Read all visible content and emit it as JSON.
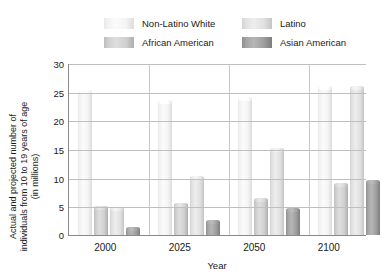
{
  "legend": {
    "items": [
      {
        "label": "Non-Latino White",
        "key": "white",
        "color": "#f2f2f2"
      },
      {
        "label": "Latino",
        "key": "latino",
        "color": "#e4e4e4"
      },
      {
        "label": "African American",
        "key": "african",
        "color": "#cfcfcf"
      },
      {
        "label": "Asian American",
        "key": "asian",
        "color": "#9e9e9e"
      }
    ]
  },
  "axes": {
    "y_title_line1": "Actual and projected number of",
    "y_title_line2": "individuals from 10 to 19 years of age",
    "y_title_line3": "(in millions)",
    "x_title": "Year",
    "y_ticks": [
      "0",
      "5",
      "10",
      "15",
      "20",
      "25",
      "30"
    ]
  },
  "chart_data": {
    "type": "bar",
    "title": "",
    "xlabel": "Year",
    "ylabel": "Actual and projected number of individuals from 10 to 19 years of age (in millions)",
    "ylim": [
      0,
      30
    ],
    "ytick_step": 5,
    "grid": true,
    "legend_position": "top",
    "categories": [
      "2000",
      "2025",
      "2050",
      "2100"
    ],
    "series": [
      {
        "name": "Non-Latino White",
        "color": "#f2f2f2",
        "values": [
          25.0,
          23.2,
          23.8,
          25.6
        ]
      },
      {
        "name": "African American",
        "color": "#cfcfcf",
        "values": [
          4.7,
          5.3,
          6.1,
          8.7
        ]
      },
      {
        "name": "Latino",
        "color": "#e4e4e4",
        "values": [
          4.6,
          10.0,
          14.8,
          25.7
        ]
      },
      {
        "name": "Asian American",
        "color": "#9e9e9e",
        "values": [
          1.0,
          2.3,
          4.4,
          9.3
        ]
      }
    ]
  }
}
